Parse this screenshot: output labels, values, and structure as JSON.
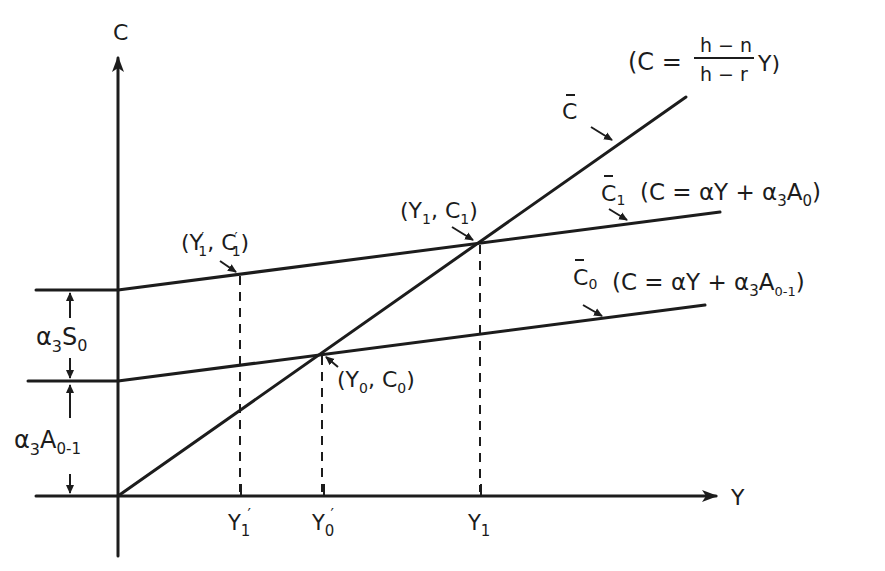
{
  "diagram": {
    "type": "economics consumption function diagram",
    "axes": {
      "y_axis_label": "C",
      "x_axis_label": "Y"
    },
    "lines": [
      {
        "id": "C_bar",
        "label": "C̄",
        "equation": "(C = (h−n)/(h−r) Y)",
        "eq_prefix": "(C =",
        "eq_num": "h − n",
        "eq_den": "h − r",
        "eq_suffix": "Y)"
      },
      {
        "id": "C_bar_1",
        "label": "C̄",
        "label_sub": "1",
        "equation": "(C = αY + α₃A₀)",
        "eq_main": "(C = αY + α",
        "eq_sub1": "3",
        "eq_mid": "A",
        "eq_sub2": "0",
        "eq_end": ")"
      },
      {
        "id": "C_bar_0",
        "label": "C̄",
        "label_sub": "0",
        "equation": "(C = αY + α₃A₀₋₁)",
        "eq_main": "(C = αY + α",
        "eq_sub1": "3",
        "eq_mid": "A",
        "eq_sub2": "0-1",
        "eq_end": ")"
      }
    ],
    "points": [
      {
        "id": "Y1p_C1p",
        "label": "(Y′₁, C′₁)",
        "text": "(Y",
        "sub1": "1",
        "mid": ", C",
        "sub2": "1",
        "end": ")"
      },
      {
        "id": "Y1_C1",
        "label": "(Y₁, C₁)",
        "text": "(Y",
        "sub1": "1",
        "mid": ", C",
        "sub2": "1",
        "end": ")"
      },
      {
        "id": "Y0_C0",
        "label": "(Y₀, C₀)",
        "text": "(Y",
        "sub1": "0",
        "mid": ", C",
        "sub2": "0",
        "end": ")"
      }
    ],
    "x_ticks": [
      {
        "label": "Y",
        "sub": "1",
        "prime": "′"
      },
      {
        "label": "Y",
        "sub": "0",
        "prime": "′"
      },
      {
        "label": "Y",
        "sub": "1",
        "prime": ""
      }
    ],
    "brackets": [
      {
        "id": "a3S0",
        "label": "α₃S₀",
        "main": "α",
        "sub1": "3",
        "mid": "S",
        "sub2": "0"
      },
      {
        "id": "a3A01",
        "label": "α₃A₀₋₁",
        "main": "α",
        "sub1": "3",
        "mid": "A",
        "sub2": "0-1"
      }
    ]
  }
}
